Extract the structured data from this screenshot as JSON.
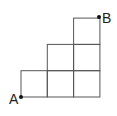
{
  "diagram": {
    "type": "staircase-grid",
    "points": {
      "start": {
        "label": "A"
      },
      "end": {
        "label": "B"
      }
    },
    "rows": [
      {
        "row": 1,
        "cells": 3
      },
      {
        "row": 2,
        "cells": 2
      },
      {
        "row": 3,
        "cells": 1
      }
    ],
    "line_color": "#555555",
    "dot_color": "#111111"
  }
}
